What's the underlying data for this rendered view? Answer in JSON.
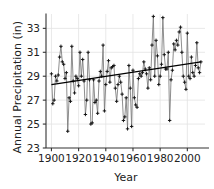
{
  "figure": {
    "background": "#ffffff",
    "foreground": "#222222"
  },
  "axes": {
    "xlabel": "Year",
    "ylabel": "Annual Precipitation (in)",
    "xticks": [
      1900,
      1920,
      1940,
      1960,
      1980,
      2000
    ],
    "xticklabels": [
      "1900",
      "1920",
      "1940",
      "1960",
      "1980",
      "2000"
    ],
    "yticks": [
      23,
      25,
      27,
      29,
      31,
      33
    ],
    "yticklabels": [
      "23",
      "25",
      "27",
      "29",
      "31",
      "33"
    ],
    "xlim": [
      1896,
      2013
    ],
    "ylim": [
      23,
      34.2
    ]
  },
  "chart_data": {
    "type": "line",
    "title": "",
    "xlabel": "Year",
    "ylabel": "Annual Precipitation (in)",
    "xlim": [
      1896,
      2013
    ],
    "ylim": [
      23,
      34.2
    ],
    "grid": true,
    "legend": "none",
    "marker": "+",
    "line_color": "#7a7a7a",
    "marker_color": "#111111",
    "trend_color": "#000000",
    "annotations": [],
    "series": [
      {
        "name": "Annual Precipitation",
        "x": [
          1900,
          1901,
          1902,
          1903,
          1904,
          1905,
          1906,
          1907,
          1908,
          1909,
          1910,
          1911,
          1912,
          1913,
          1914,
          1915,
          1916,
          1917,
          1918,
          1919,
          1920,
          1921,
          1922,
          1923,
          1924,
          1925,
          1926,
          1927,
          1928,
          1929,
          1930,
          1931,
          1932,
          1933,
          1934,
          1935,
          1936,
          1937,
          1938,
          1939,
          1940,
          1941,
          1942,
          1943,
          1944,
          1945,
          1946,
          1947,
          1948,
          1949,
          1950,
          1951,
          1952,
          1953,
          1954,
          1955,
          1956,
          1957,
          1958,
          1959,
          1960,
          1961,
          1962,
          1963,
          1964,
          1965,
          1966,
          1967,
          1968,
          1969,
          1970,
          1971,
          1972,
          1973,
          1974,
          1975,
          1976,
          1977,
          1978,
          1979,
          1980,
          1981,
          1982,
          1983,
          1984,
          1985,
          1986,
          1987,
          1988,
          1989,
          1990,
          1991,
          1992,
          1993,
          1994,
          1995,
          1996,
          1997,
          1998,
          1999,
          2000,
          2001,
          2002,
          2003,
          2004,
          2005,
          2006,
          2007,
          2008,
          2009,
          2010
        ],
        "values": [
          29.2,
          26.7,
          27.0,
          29.0,
          28.6,
          29.1,
          30.6,
          31.5,
          30.2,
          30.0,
          28.8,
          29.3,
          24.4,
          27.2,
          26.9,
          31.5,
          28.6,
          27.6,
          29.0,
          28.8,
          28.2,
          31.0,
          29.0,
          30.4,
          28.6,
          25.8,
          27.0,
          31.0,
          28.7,
          25.0,
          25.1,
          28.7,
          26.8,
          27.0,
          25.9,
          28.6,
          29.4,
          29.0,
          31.6,
          26.1,
          28.3,
          29.4,
          30.3,
          28.5,
          29.7,
          29.8,
          29.9,
          28.0,
          26.9,
          28.3,
          29.0,
          28.5,
          27.5,
          25.3,
          25.6,
          27.2,
          24.6,
          29.9,
          28.0,
          24.8,
          29.5,
          27.2,
          26.6,
          26.4,
          28.8,
          29.2,
          29.0,
          29.3,
          30.2,
          29.6,
          29.2,
          28.0,
          29.7,
          28.7,
          31.6,
          34.0,
          29.0,
          32.0,
          30.7,
          28.3,
          29.0,
          30.0,
          33.9,
          30.8,
          29.6,
          29.6,
          31.0,
          25.3,
          28.7,
          29.5,
          31.7,
          31.2,
          32.0,
          31.6,
          32.7,
          33.1,
          31.0,
          29.0,
          28.5,
          27.9,
          32.6,
          29.0,
          28.8,
          30.6,
          29.3,
          29.0,
          29.9,
          31.8,
          29.7,
          29.3,
          30.2
        ]
      }
    ],
    "trendline": {
      "name": "Linear trend",
      "x": [
        1900,
        2010
      ],
      "y": [
        28.3,
        30.2
      ],
      "slope_per_year": 0.01727,
      "intercept_1900": 28.3
    }
  }
}
